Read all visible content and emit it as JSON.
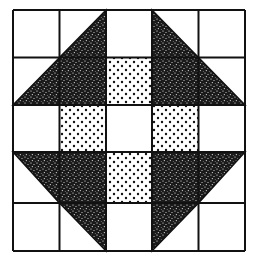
{
  "diagram": {
    "title": "",
    "type": "quilt-block",
    "grid": {
      "rows": 5,
      "cols": 5
    },
    "colors": {
      "background": "#ffffff",
      "line": "#111111",
      "dark": "#1a1a1a",
      "dot": "#111111"
    },
    "cells": [
      [
        "white",
        "tri-br",
        "white",
        "tri-bl",
        "white"
      ],
      [
        "tri-br",
        "dark",
        "dots",
        "dark",
        "tri-bl"
      ],
      [
        "white",
        "dots",
        "white",
        "dots",
        "white"
      ],
      [
        "tri-tr",
        "dark",
        "dots",
        "dark",
        "tri-tl"
      ],
      [
        "white",
        "tri-tr",
        "white",
        "tri-tl",
        "white"
      ]
    ],
    "legend": {
      "white": "plain white square",
      "dark": "dark speckled fabric square",
      "dots": "white with black dots fabric square",
      "tri-br": "half-square triangle, dark in lower-right",
      "tri-bl": "half-square triangle, dark in lower-left",
      "tri-tr": "half-square triangle, dark in upper-right",
      "tri-tl": "half-square triangle, dark in upper-left"
    }
  }
}
